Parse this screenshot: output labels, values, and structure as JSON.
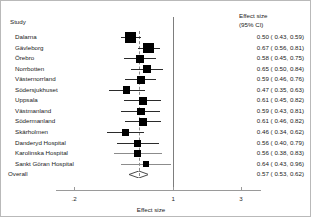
{
  "headers": {
    "study": "Study",
    "effect_line1": "Effect size",
    "effect_line2": "(95% CI)"
  },
  "axis": {
    "title": "Effect size",
    "ticks": [
      ".2",
      "1",
      "3"
    ],
    "tick_values": [
      0.2,
      1,
      3
    ],
    "scale": "log"
  },
  "overall_label": "Overall",
  "chart_data": {
    "type": "forest",
    "title": "",
    "xlabel": "Effect size",
    "ylabel": "Study",
    "xscale": "log",
    "xlim": [
      0.17,
      3.4
    ],
    "xticks": [
      0.2,
      1,
      3
    ],
    "xticklabels": [
      ".2",
      "1",
      "3"
    ],
    "null_line": 1,
    "pooled_line": 0.57,
    "grid": false,
    "legend": "none",
    "columns": [
      "Study",
      "Effect size (95% CI)"
    ],
    "studies": [
      {
        "label": "Dalarna",
        "estimate": 0.5,
        "ci_low": 0.43,
        "ci_high": 0.59,
        "weight": 1.0,
        "text": "0.50 ( 0.43, 0.59)"
      },
      {
        "label": "Gävleborg",
        "estimate": 0.67,
        "ci_low": 0.56,
        "ci_high": 0.81,
        "weight": 0.98,
        "text": "0.67 ( 0.56, 0.81)"
      },
      {
        "label": "Örebro",
        "estimate": 0.58,
        "ci_low": 0.45,
        "ci_high": 0.75,
        "weight": 0.55,
        "text": "0.58 ( 0.45, 0.75)"
      },
      {
        "label": "Norrbotten",
        "estimate": 0.65,
        "ci_low": 0.5,
        "ci_high": 0.84,
        "weight": 0.6,
        "text": "0.65 ( 0.50, 0.84)"
      },
      {
        "label": "Västernorrland",
        "estimate": 0.59,
        "ci_low": 0.46,
        "ci_high": 0.76,
        "weight": 0.62,
        "text": "0.59 ( 0.46, 0.76)"
      },
      {
        "label": "Södersjukhuset",
        "estimate": 0.47,
        "ci_low": 0.35,
        "ci_high": 0.63,
        "weight": 0.52,
        "text": "0.47 ( 0.35, 0.63)"
      },
      {
        "label": "Uppsala",
        "estimate": 0.61,
        "ci_low": 0.45,
        "ci_high": 0.82,
        "weight": 0.5,
        "text": "0.61 ( 0.45, 0.82)"
      },
      {
        "label": "Västmanland",
        "estimate": 0.59,
        "ci_low": 0.43,
        "ci_high": 0.81,
        "weight": 0.5,
        "text": "0.59 ( 0.43, 0.81)"
      },
      {
        "label": "Södermanland",
        "estimate": 0.61,
        "ci_low": 0.46,
        "ci_high": 0.82,
        "weight": 0.56,
        "text": "0.61 ( 0.46, 0.82)"
      },
      {
        "label": "Skärholmen",
        "estimate": 0.46,
        "ci_low": 0.34,
        "ci_high": 0.62,
        "weight": 0.5,
        "text": "0.46 ( 0.34, 0.62)"
      },
      {
        "label": "Danderyd Hospital",
        "estimate": 0.56,
        "ci_low": 0.4,
        "ci_high": 0.79,
        "weight": 0.44,
        "text": "0.56 ( 0.40, 0.79)"
      },
      {
        "label": "Karolinska Hospital",
        "estimate": 0.56,
        "ci_low": 0.38,
        "ci_high": 0.83,
        "weight": 0.4,
        "text": "0.56 ( 0.38, 0.83)"
      },
      {
        "label": "Sankt Göran Hospital",
        "estimate": 0.64,
        "ci_low": 0.43,
        "ci_high": 0.96,
        "weight": 0.33,
        "text": "0.64 ( 0.43, 0.96)"
      }
    ],
    "overall": {
      "label": "Overall",
      "estimate": 0.57,
      "ci_low": 0.53,
      "ci_high": 0.62,
      "text": "0.57 ( 0.53, 0.62)"
    }
  }
}
